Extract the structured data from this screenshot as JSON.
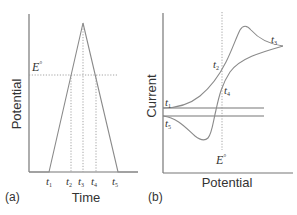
{
  "panel_a": {
    "tag": "(a)",
    "xlabel": "Time",
    "ylabel": "Potential",
    "e0_label": "E°",
    "e0_main": "E",
    "e0_sup": "°",
    "time_marks": [
      {
        "base": "t",
        "sub": "1"
      },
      {
        "base": "t",
        "sub": "2"
      },
      {
        "base": "t",
        "sub": "3"
      },
      {
        "base": "t",
        "sub": "4"
      },
      {
        "base": "t",
        "sub": "5"
      }
    ]
  },
  "panel_b": {
    "tag": "(b)",
    "xlabel": "Potential",
    "ylabel": "Current",
    "e0_label": "E°",
    "e0_main": "E",
    "e0_sup": "°",
    "curve_points": [
      {
        "base": "t",
        "sub": "1"
      },
      {
        "base": "t",
        "sub": "2"
      },
      {
        "base": "t",
        "sub": "3"
      },
      {
        "base": "t",
        "sub": "4"
      },
      {
        "base": "t",
        "sub": "5"
      }
    ]
  },
  "colors": {
    "axis": "#777777",
    "curve": "#8a8a8a",
    "dotted": "#9a9a9a",
    "text": "#333333"
  }
}
